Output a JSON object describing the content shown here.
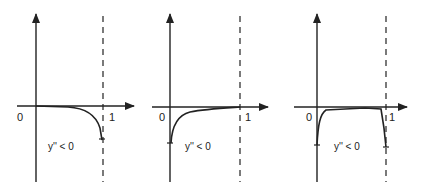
{
  "figure": {
    "stroke_color": "#222222",
    "background": "#ffffff",
    "panels": [
      {
        "id": "panel-1",
        "origin_label": "0",
        "x_end_label": "1",
        "condition_label": "y'' < 0",
        "shape": "flat near 0 along x-axis, bending sharply downward near x = 1"
      },
      {
        "id": "panel-2",
        "origin_label": "0",
        "x_end_label": "1",
        "condition_label": "y'' < 0",
        "shape": "starts well below axis at x = 0, rises steeply then flattens toward x-axis near x = 1"
      },
      {
        "id": "panel-3",
        "origin_label": "0",
        "x_end_label": "1",
        "condition_label": "y'' < 0",
        "shape": "boundary layers at both ends: steep rise near x = 0, flat near axis, steep drop near x = 1"
      }
    ]
  }
}
